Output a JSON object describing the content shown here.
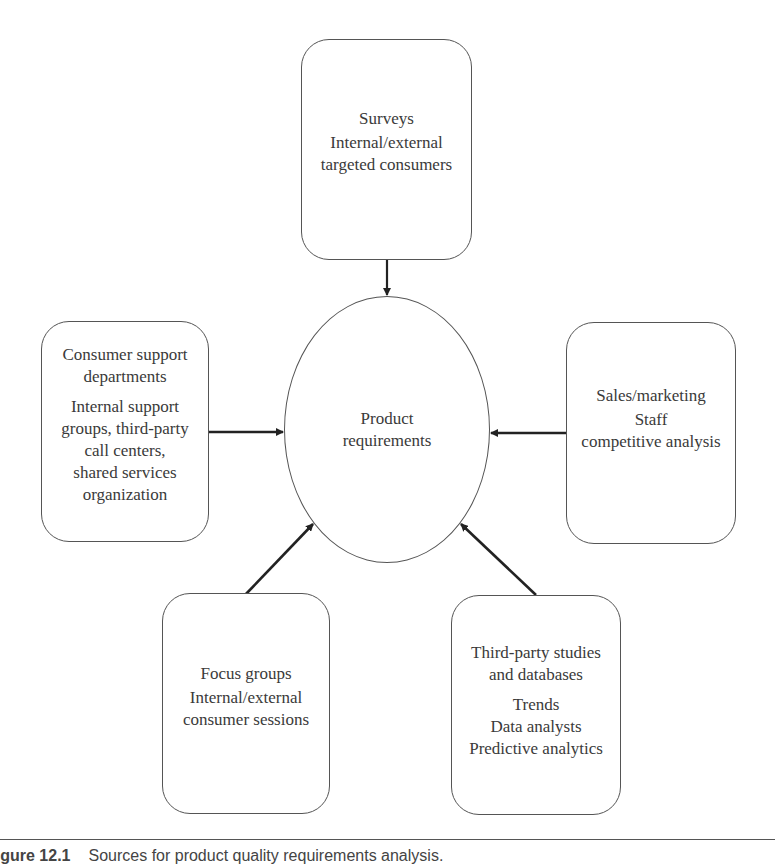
{
  "diagram": {
    "center": {
      "label": "Product\nrequirements"
    },
    "sources": [
      {
        "id": "surveys",
        "title": "Surveys",
        "detail": "Internal/external\ntargeted consumers",
        "position": "top"
      },
      {
        "id": "consumer-support",
        "title": "Consumer support\ndepartments",
        "detail": "Internal support\ngroups, third-party\ncall centers,\nshared services\norganization",
        "position": "left"
      },
      {
        "id": "sales-marketing",
        "title": "Sales/marketing",
        "detail": "Staff\ncompetitive analysis",
        "position": "right"
      },
      {
        "id": "focus-groups",
        "title": "Focus groups",
        "detail": "Internal/external\nconsumer sessions",
        "position": "bottom-left"
      },
      {
        "id": "third-party-studies",
        "title": "Third-party studies\nand databases",
        "detail": "Trends\nData analysts\nPredictive analytics",
        "position": "bottom-right"
      }
    ],
    "arrows": [
      {
        "from": "surveys",
        "to": "center"
      },
      {
        "from": "consumer-support",
        "to": "center"
      },
      {
        "from": "sales-marketing",
        "to": "center"
      },
      {
        "from": "focus-groups",
        "to": "center"
      },
      {
        "from": "third-party-studies",
        "to": "center"
      }
    ]
  },
  "caption": {
    "figure_number": "Figure 12.1",
    "text": "Sources for product quality requirements analysis."
  },
  "colors": {
    "stroke": "#555555",
    "text": "#3a3a3a",
    "arrow": "#222222"
  }
}
